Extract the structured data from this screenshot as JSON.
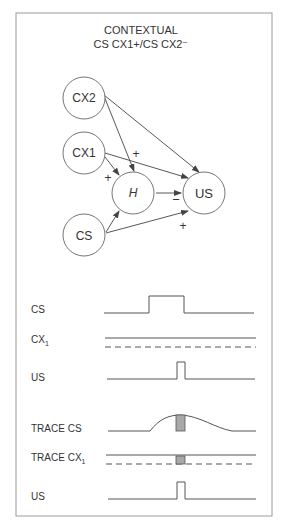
{
  "header": {
    "title_line1": "CONTEXTUAL",
    "title_line2": "CS  CX1+/CS CX2⁻"
  },
  "network": {
    "nodes": [
      {
        "id": "CX2",
        "label": "CX2",
        "italic": false
      },
      {
        "id": "CX1",
        "label": "CX1",
        "italic": false
      },
      {
        "id": "H",
        "label": "H",
        "italic": true
      },
      {
        "id": "US",
        "label": "US",
        "italic": false
      },
      {
        "id": "CS",
        "label": "CS",
        "italic": false
      }
    ],
    "edges": [
      {
        "from": "CX2",
        "to": "H"
      },
      {
        "from": "CX2",
        "to": "US"
      },
      {
        "from": "CX1",
        "to": "H",
        "sign": "+"
      },
      {
        "from": "CX1",
        "to": "US",
        "sign": "+"
      },
      {
        "from": "H",
        "to": "US",
        "sign": "−"
      },
      {
        "from": "CS",
        "to": "H"
      },
      {
        "from": "CS",
        "to": "US",
        "sign": "+"
      }
    ],
    "signs": {
      "cx1_h": "+",
      "cx1_us": "+",
      "h_us": "−",
      "cs_us": "+"
    }
  },
  "timing": {
    "rows": [
      {
        "label": "CS",
        "type": "pulse"
      },
      {
        "label": "CX",
        "subscript": "1",
        "type": "context"
      },
      {
        "label": "US",
        "type": "short-pulse"
      }
    ]
  },
  "trace": {
    "rows": [
      {
        "label": "TRACE  CS",
        "type": "trace-curve"
      },
      {
        "label": "TRACE  CX",
        "subscript": "1",
        "type": "context-trace"
      },
      {
        "label": "US",
        "type": "short-pulse"
      }
    ]
  },
  "colors": {
    "line": "#555555",
    "frame": "#9a9a9a",
    "shade": "#a8a8a8"
  }
}
